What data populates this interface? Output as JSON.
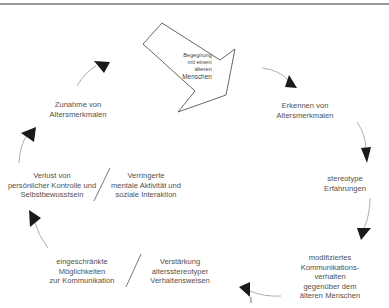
{
  "diagram": {
    "type": "cycle",
    "start": {
      "lines": [
        "Begegnung",
        "mit einem",
        "älteren",
        "Menschen"
      ]
    },
    "nodes": [
      {
        "id": "erkennen",
        "lines": [
          "Erkennen von",
          "Altersmerkmalen"
        ]
      },
      {
        "id": "stereotype",
        "lines": [
          "stereotype",
          "Erfahrungen"
        ]
      },
      {
        "id": "modifiziert",
        "lines": [
          "modifiziertes",
          "Kommunikations-",
          "verhalten",
          "gegenüber dem",
          "älteren Menschen"
        ]
      },
      {
        "id": "verstaerkung",
        "lines": [
          "Verstärkung",
          "altersstereotyper",
          "Verhaltensweisen"
        ]
      },
      {
        "id": "eingeschraenkt",
        "lines": [
          "eingeschränkte",
          "Möglichkeiten",
          "zur Kommunikation"
        ]
      },
      {
        "id": "verringert",
        "lines": [
          "Verringerte",
          "mentale Aktivität und",
          "soziale Interaktion"
        ]
      },
      {
        "id": "verlust",
        "lines": [
          "Verlust von",
          "persönlicher Kontrolle und",
          "Selbstbewusstsein"
        ]
      },
      {
        "id": "zunahme",
        "lines": [
          "Zunahme von",
          "Altersmerkmalen"
        ]
      }
    ],
    "colors": {
      "text": "#505050",
      "arrow_fill": "#1a1a1a",
      "arc_stroke": "#9a9a9a",
      "frame_line": "#9a9a9a"
    }
  }
}
